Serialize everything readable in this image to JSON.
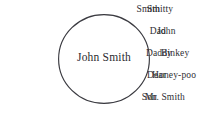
{
  "diagram": {
    "type": "labeled-circle",
    "width": 219,
    "height": 113,
    "background_color": "#ffffff",
    "text_color": "#303034",
    "circle_stroke_color": "#3a3a40",
    "center": {
      "label": "John Smith"
    },
    "left_labels": [
      {
        "text": "Smith",
        "right": 160,
        "top": 4
      },
      {
        "text": "Dad",
        "right": 166,
        "top": 26
      },
      {
        "text": "Daddy",
        "right": 172,
        "top": 48
      },
      {
        "text": "Dear",
        "right": 166,
        "top": 70
      },
      {
        "text": "Son",
        "right": 157,
        "top": 92
      }
    ],
    "right_labels": [
      {
        "text": "Smitty",
        "left": 147,
        "top": 4
      },
      {
        "text": "John",
        "left": 157,
        "top": 26
      },
      {
        "text": "Binkey",
        "left": 161,
        "top": 48
      },
      {
        "text": "Honey-poo",
        "left": 152,
        "top": 70
      },
      {
        "text": "Mr. Smith",
        "left": 145,
        "top": 92
      }
    ]
  }
}
